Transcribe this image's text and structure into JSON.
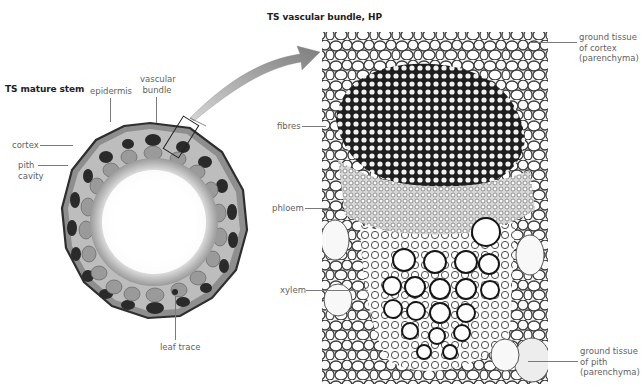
{
  "figure": {
    "left_panel": {
      "title": "TS mature stem",
      "labels": {
        "epidermis": "epidermis",
        "vascular_bundle_line1": "vascular",
        "vascular_bundle_line2": "bundle",
        "cortex": "cortex",
        "pith_cavity_line1": "pith",
        "pith_cavity_line2": "cavity",
        "leaf_trace": "leaf trace"
      }
    },
    "right_panel": {
      "title": "TS vascular bundle, HP",
      "labels": {
        "fibres": "fibres",
        "phloem": "phloem",
        "xylem": "xylem",
        "ground_cortex_line1": "ground tissue",
        "ground_cortex_line2": "of cortex",
        "ground_cortex_line3": "(parenchyma)",
        "ground_pith_line1": "ground tissue",
        "ground_pith_line2": "of pith",
        "ground_pith_line3": "(parenchyma)"
      }
    },
    "arrow": {
      "meaning": "magnification-of-boxed-vascular-bundle",
      "color": "#8a8a8a"
    }
  }
}
